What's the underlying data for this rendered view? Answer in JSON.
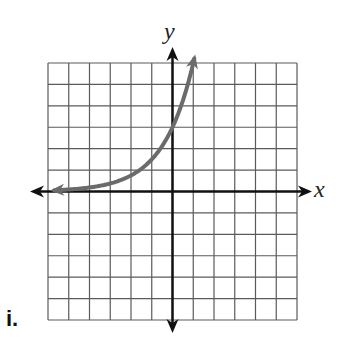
{
  "figure_label": "i.",
  "axes": {
    "x_label": "x",
    "y_label": "y"
  },
  "colors": {
    "grid": "#5a5a5a",
    "axis": "#111111",
    "curve": "#6b6b6b"
  },
  "chart_data": {
    "type": "line",
    "title": "",
    "xlabel": "x",
    "ylabel": "y",
    "grid": true,
    "xlim": [
      -6,
      6
    ],
    "ylim": [
      -6,
      6
    ],
    "grid_columns": 12,
    "grid_rows": 12,
    "series": [
      {
        "name": "exponential growth curve",
        "function": "y = 3 * 2^x (approximate)",
        "y_intercept": 3,
        "horizontal_asymptote": 0,
        "x": [
          -6,
          -5,
          -4,
          -3,
          -2,
          -1,
          0,
          0.5,
          1.1
        ],
        "y": [
          0.05,
          0.1,
          0.19,
          0.38,
          0.75,
          1.5,
          3,
          4.24,
          6
        ],
        "arrows": "both ends"
      }
    ]
  }
}
